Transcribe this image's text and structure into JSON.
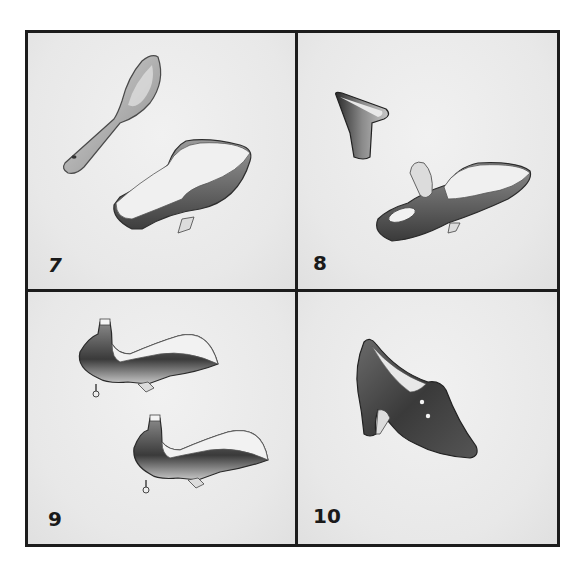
{
  "figure": {
    "panels": [
      {
        "number": "7",
        "content": "heel cup and shoe last with insole"
      },
      {
        "number": "8",
        "content": "heel block and last with heel flap lifted"
      },
      {
        "number": "9",
        "content": "two lasts with heel attached"
      },
      {
        "number": "10",
        "content": "finished high-heel shoe with side buttons"
      }
    ]
  }
}
